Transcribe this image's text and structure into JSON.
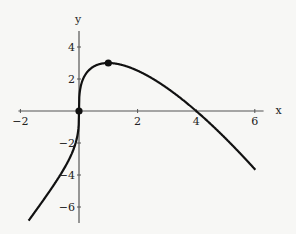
{
  "chart_data": {
    "type": "line",
    "title": "",
    "function": "y = x^(1/3) * (4 - x)",
    "xlabel": "x",
    "ylabel": "y",
    "xlim": [
      -2,
      6.3
    ],
    "ylim": [
      -7,
      5
    ],
    "x_ticks": [
      -2,
      2,
      4,
      6
    ],
    "x_tick_labels": [
      "−2",
      "2",
      "4",
      "6"
    ],
    "y_ticks": [
      -6,
      -4,
      -2,
      2,
      4
    ],
    "y_tick_labels": [
      "−6",
      "−4",
      "−2",
      "2",
      "4"
    ],
    "grid": false,
    "marked_points": [
      {
        "x": 0,
        "y": 0
      },
      {
        "x": 1,
        "y": 3
      }
    ],
    "series": [
      {
        "name": "f(x)",
        "x": [
          -1.7,
          -1,
          -0.5,
          -0.1,
          0,
          0.1,
          0.5,
          1,
          2,
          3,
          4,
          5,
          6
        ],
        "values": [
          -6.8,
          -5,
          -3.57,
          -1.9,
          0,
          1.82,
          2.78,
          3,
          2.52,
          1.44,
          0,
          -1.71,
          -3.63
        ]
      }
    ]
  }
}
